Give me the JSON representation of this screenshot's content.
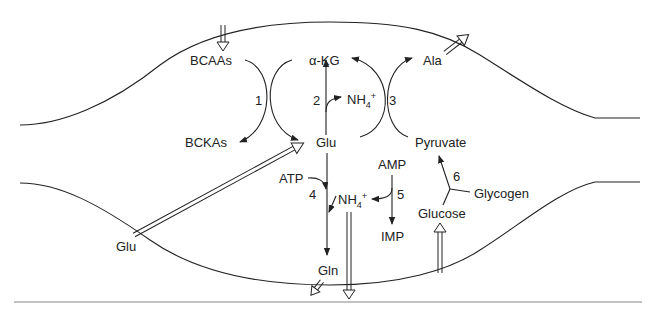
{
  "diagram": {
    "compartment_boundary": "muscle cell membrane",
    "metabolites": {
      "bcaas": "BCAAs",
      "bckas": "BCKAs",
      "akg": "α-KG",
      "glu_in": "Glu",
      "glu_out": "Glu",
      "nh4_top": "NH",
      "nh4_top_sub": "4",
      "nh4_top_sup": "+",
      "nh4_mid": "NH",
      "nh4_mid_sub": "4",
      "nh4_mid_sup": "+",
      "ala": "Ala",
      "pyruvate": "Pyruvate",
      "atp": "ATP",
      "amp": "AMP",
      "imp": "IMP",
      "gln": "Gln",
      "glucose": "Glucose",
      "glycogen": "Glycogen"
    },
    "reactions": {
      "r1": "1",
      "r2": "2",
      "r3": "3",
      "r4": "4",
      "r5": "5",
      "r6": "6"
    },
    "transport_arrows": [
      {
        "name": "bcaa-uptake",
        "direction": "in"
      },
      {
        "name": "ala-release",
        "direction": "out"
      },
      {
        "name": "glu-uptake",
        "direction": "in"
      },
      {
        "name": "gln-release",
        "direction": "out"
      },
      {
        "name": "nh4-release",
        "direction": "out"
      },
      {
        "name": "glucose-uptake",
        "direction": "in"
      }
    ],
    "colors": {
      "line": "#222222",
      "background": "#ffffff"
    }
  }
}
